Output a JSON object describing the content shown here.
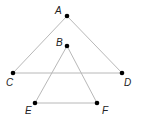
{
  "diagram": {
    "points": {
      "A": {
        "label": "A"
      },
      "B": {
        "label": "B"
      },
      "C": {
        "label": "C"
      },
      "D": {
        "label": "D"
      },
      "E": {
        "label": "E"
      },
      "F": {
        "label": "F"
      }
    },
    "segments": [
      [
        "A",
        "C"
      ],
      [
        "A",
        "D"
      ],
      [
        "C",
        "D"
      ],
      [
        "B",
        "E"
      ],
      [
        "B",
        "F"
      ],
      [
        "E",
        "F"
      ]
    ],
    "colors": {
      "line": "#b8b8b8",
      "point": "#000000",
      "label": "#222222"
    }
  }
}
